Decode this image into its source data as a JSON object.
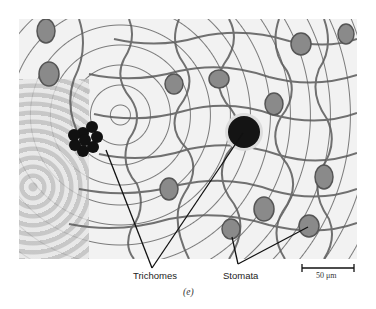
{
  "figure": {
    "panel_label": "(e)",
    "labels": {
      "trichomes": "Trichomes",
      "stomata": "Stomata"
    },
    "scale_bar": {
      "text": "50 μm"
    },
    "colors": {
      "background": "#ffffff",
      "cell_wall": "#555555",
      "trichome": "#151515",
      "leader_line": "#111111"
    }
  }
}
